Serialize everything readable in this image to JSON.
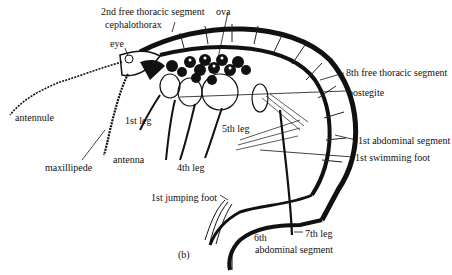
{
  "figure": {
    "panel_label": "(b)",
    "labels": [
      {
        "id": "second_free_thoracic_segment",
        "text": "2nd free thoracic segment",
        "x": 101,
        "y": 6
      },
      {
        "id": "ova",
        "text": "ova",
        "x": 216,
        "y": 6
      },
      {
        "id": "cephalothorax",
        "text": "cephalothorax",
        "x": 105,
        "y": 19
      },
      {
        "id": "eye",
        "text": "eye",
        "x": 110,
        "y": 38
      },
      {
        "id": "eighth_free_thoracic_segment",
        "text": "8th free thoracic segment",
        "x": 346,
        "y": 67
      },
      {
        "id": "oostegite",
        "text": "oostegite",
        "x": 348,
        "y": 87
      },
      {
        "id": "antennule",
        "text": "antennule",
        "x": 15,
        "y": 112
      },
      {
        "id": "first_leg",
        "text": "1st leg",
        "x": 125,
        "y": 115
      },
      {
        "id": "fifth_leg",
        "text": "5th leg",
        "x": 222,
        "y": 123
      },
      {
        "id": "first_abdominal_segment",
        "text": "1st abdominal segment",
        "x": 358,
        "y": 135
      },
      {
        "id": "first_swimming_foot",
        "text": "1st swimming foot",
        "x": 355,
        "y": 152
      },
      {
        "id": "antenna",
        "text": "antenna",
        "x": 113,
        "y": 154
      },
      {
        "id": "maxillipede",
        "text": "maxillipede",
        "x": 45,
        "y": 162
      },
      {
        "id": "fourth_leg",
        "text": "4th leg",
        "x": 177,
        "y": 162
      },
      {
        "id": "first_jumping_foot",
        "text": "1st jumping foot",
        "x": 151,
        "y": 192
      },
      {
        "id": "seventh_leg",
        "text": "7th leg",
        "x": 305,
        "y": 228
      },
      {
        "id": "sixth",
        "text": "6th",
        "x": 254,
        "y": 232
      },
      {
        "id": "abdominal_segment",
        "text": "abdominal segment",
        "x": 255,
        "y": 244
      }
    ]
  }
}
